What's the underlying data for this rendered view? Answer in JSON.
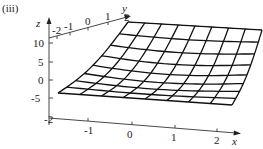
{
  "panel_label": "(iii)",
  "chart_data": {
    "type": "surface",
    "title": "",
    "panel": "(iii)",
    "xlabel": "x",
    "ylabel": "y",
    "zlabel": "z",
    "x_ticks": [
      "-2",
      "-1",
      "0",
      "1",
      "2"
    ],
    "y_ticks": [
      "-2",
      "-1",
      "0",
      "1",
      "2"
    ],
    "z_ticks": [
      "10",
      "5",
      "0",
      "-5"
    ],
    "xlim": [
      -2,
      2
    ],
    "ylim": [
      -2,
      2
    ],
    "zlim": [
      -10,
      12
    ],
    "grid_resolution": [
      9,
      9
    ],
    "corner_values": {
      "x=-2,y=-2": -4,
      "x=2,y=-2": -2,
      "x=-2,y=2": 12,
      "x=2,y=2": 8
    }
  },
  "colors": {
    "mesh": "#111111",
    "axes": "#333333",
    "text": "#222222",
    "background": "#ffffff"
  }
}
